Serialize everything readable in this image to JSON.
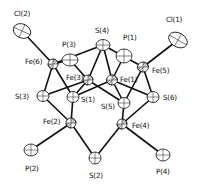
{
  "diagram": {
    "type": "ORTEP molecular structure",
    "atoms": [
      {
        "id": "Cl2",
        "label": "Cl(2)",
        "x": 22,
        "y": 31,
        "rx": 9,
        "ry": 7,
        "rot": 25,
        "lx": 14,
        "ly": 10,
        "hatched": false
      },
      {
        "id": "Fe6",
        "label": "Fe(6)",
        "x": 53,
        "y": 64,
        "rx": 5,
        "ry": 5,
        "rot": 0,
        "lx": 25,
        "ly": 58,
        "hatched": true
      },
      {
        "id": "P3",
        "label": "P(3)",
        "x": 70,
        "y": 60,
        "rx": 8,
        "ry": 6,
        "rot": 0,
        "lx": 62,
        "ly": 41,
        "hatched": false
      },
      {
        "id": "S4",
        "label": "S(4)",
        "x": 103,
        "y": 45,
        "rx": 7,
        "ry": 5.5,
        "rot": 0,
        "lx": 95,
        "ly": 27,
        "hatched": false
      },
      {
        "id": "P1",
        "label": "P(1)",
        "x": 124,
        "y": 56,
        "rx": 8,
        "ry": 7,
        "rot": 0,
        "lx": 123,
        "ly": 34,
        "hatched": false
      },
      {
        "id": "Cl1",
        "label": "Cl(1)",
        "x": 178,
        "y": 40,
        "rx": 10,
        "ry": 7,
        "rot": 30,
        "lx": 166,
        "ly": 16,
        "hatched": false
      },
      {
        "id": "Fe5",
        "label": "Fe(5)",
        "x": 143,
        "y": 67,
        "rx": 5.5,
        "ry": 5,
        "rot": 0,
        "lx": 152,
        "ly": 67,
        "hatched": true
      },
      {
        "id": "Fe3",
        "label": "Fe(3)",
        "x": 88,
        "y": 80,
        "rx": 5,
        "ry": 5,
        "rot": 0,
        "lx": 66,
        "ly": 74,
        "hatched": true
      },
      {
        "id": "Fe1",
        "label": "Fe(1)",
        "x": 112,
        "y": 80,
        "rx": 5.5,
        "ry": 5,
        "rot": 0,
        "lx": 120,
        "ly": 76,
        "hatched": true
      },
      {
        "id": "S1",
        "label": "S(1)",
        "x": 73,
        "y": 97,
        "rx": 6,
        "ry": 5.5,
        "rot": 0,
        "lx": 81,
        "ly": 96,
        "hatched": false
      },
      {
        "id": "S3",
        "label": "S(3)",
        "x": 43,
        "y": 96,
        "rx": 6,
        "ry": 5.5,
        "rot": 0,
        "lx": 15,
        "ly": 93,
        "hatched": false
      },
      {
        "id": "S5",
        "label": "S(5)",
        "x": 124,
        "y": 103,
        "rx": 6,
        "ry": 5.5,
        "rot": 0,
        "lx": 101,
        "ly": 103,
        "hatched": false
      },
      {
        "id": "S6",
        "label": "S(6)",
        "x": 153,
        "y": 97,
        "rx": 6,
        "ry": 5.5,
        "rot": 0,
        "lx": 163,
        "ly": 94,
        "hatched": false
      },
      {
        "id": "Fe2",
        "label": "Fe(2)",
        "x": 71,
        "y": 123,
        "rx": 5,
        "ry": 5,
        "rot": 0,
        "lx": 43,
        "ly": 118,
        "hatched": true
      },
      {
        "id": "Fe4",
        "label": "Fe(4)",
        "x": 122,
        "y": 124,
        "rx": 5,
        "ry": 5,
        "rot": 0,
        "lx": 132,
        "ly": 122,
        "hatched": true
      },
      {
        "id": "P2",
        "label": "P(2)",
        "x": 31,
        "y": 150,
        "rx": 7,
        "ry": 6,
        "rot": 0,
        "lx": 25,
        "ly": 165,
        "hatched": false
      },
      {
        "id": "S2",
        "label": "S(2)",
        "x": 95,
        "y": 158,
        "rx": 6,
        "ry": 6,
        "rot": 0,
        "lx": 89,
        "ly": 172,
        "hatched": false
      },
      {
        "id": "P4",
        "label": "P(4)",
        "x": 163,
        "y": 155,
        "rx": 7,
        "ry": 6,
        "rot": 0,
        "lx": 156,
        "ly": 168,
        "hatched": false
      }
    ],
    "bonds": [
      [
        "Cl2",
        "Fe6"
      ],
      [
        "Fe6",
        "P3"
      ],
      [
        "Fe6",
        "S3"
      ],
      [
        "Fe6",
        "S1"
      ],
      [
        "Fe6",
        "S4"
      ],
      [
        "P3",
        "Fe3"
      ],
      [
        "S4",
        "Fe3"
      ],
      [
        "S4",
        "Fe1"
      ],
      [
        "S4",
        "Fe5"
      ],
      [
        "P1",
        "Fe1"
      ],
      [
        "Cl1",
        "Fe5"
      ],
      [
        "Fe5",
        "S6"
      ],
      [
        "Fe5",
        "S5"
      ],
      [
        "Fe3",
        "S1"
      ],
      [
        "Fe3",
        "S5"
      ],
      [
        "Fe3",
        "S3"
      ],
      [
        "Fe1",
        "S1"
      ],
      [
        "Fe1",
        "S5"
      ],
      [
        "Fe1",
        "S6"
      ],
      [
        "S3",
        "Fe2"
      ],
      [
        "S1",
        "Fe2"
      ],
      [
        "S5",
        "Fe4"
      ],
      [
        "S6",
        "Fe4"
      ],
      [
        "Fe2",
        "P2"
      ],
      [
        "Fe2",
        "S2"
      ],
      [
        "Fe4",
        "S2"
      ],
      [
        "Fe4",
        "P4"
      ]
    ]
  }
}
